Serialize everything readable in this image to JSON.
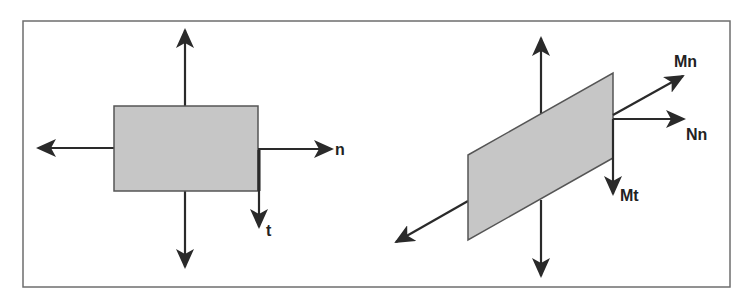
{
  "figure": {
    "background": "#ffffff",
    "frame_color": "#6e6e6e",
    "shape_fill": "#c6c6c6",
    "shape_stroke": "#555555",
    "arrow_color": "#2a2a2a"
  },
  "left_diagram": {
    "description": "Rectangular element with normal and tangential directions",
    "labels": {
      "normal": "n",
      "tangential": "t"
    }
  },
  "right_diagram": {
    "description": "Inclined plane element with normal and moment components",
    "labels": {
      "moment_normal": "Mn",
      "force_normal": "Nn",
      "moment_tangential": "Mt"
    }
  }
}
